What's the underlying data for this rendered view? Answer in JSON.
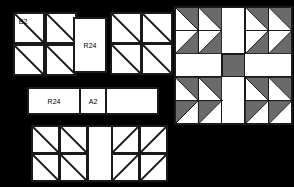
{
  "page": {
    "width": 294,
    "height": 187,
    "background": "#ffffff"
  },
  "style": {
    "outline_color": "#1a1a1a",
    "fill_light": "#ffffff",
    "fill_dark": "#6a6a6a",
    "diagonal_color": "#1a1a1a",
    "outline_width": 1.6,
    "diagonal_width": 1.8
  },
  "left_panel": {
    "name": "cut-pieces-legend",
    "description": "Cut piece groups with part labels",
    "groups": [
      {
        "id": "group-hst-topleft",
        "kind": "half-square-triangle-grid",
        "rows": 2,
        "cols": 2,
        "x": 14,
        "y": 13,
        "cell": 30,
        "gap": 2,
        "diagonal": "tl-br",
        "labels": [
          {
            "cell": 0,
            "text": "B2"
          }
        ]
      },
      {
        "id": "group-r24-vertical",
        "kind": "plain-rectangle",
        "x": 74,
        "y": 18,
        "width": 32,
        "height": 54,
        "label": "R24"
      },
      {
        "id": "group-hst-topright",
        "kind": "half-square-triangle-grid",
        "rows": 2,
        "cols": 2,
        "x": 111,
        "y": 13,
        "cell": 30,
        "gap": 1,
        "diagonal": "tl-br",
        "labels": []
      },
      {
        "id": "group-strip-r24-a2",
        "kind": "labelled-strip",
        "x": 28,
        "y": 88,
        "height": 26,
        "cells": [
          {
            "label": "R24",
            "width": 52
          },
          {
            "label": "A2",
            "width": 26
          },
          {
            "label": "",
            "width": 52
          }
        ]
      },
      {
        "id": "group-hst-bottomleft",
        "kind": "half-square-triangle-grid",
        "rows": 2,
        "cols": 2,
        "x": 32,
        "y": 126,
        "cell": 27,
        "gap": 1,
        "diagonal": "tl-br",
        "labels": []
      },
      {
        "id": "group-plain-bottomcenter",
        "kind": "plain-rectangle",
        "x": 88,
        "y": 126,
        "width": 24,
        "height": 55,
        "label": ""
      },
      {
        "id": "group-hst-bottomright",
        "kind": "half-square-triangle-grid",
        "rows": 2,
        "cols": 2,
        "x": 112,
        "y": 126,
        "cell": 27,
        "gap": 1,
        "diagonal": "bl-tr",
        "labels": []
      }
    ],
    "part_labels": [
      "B2",
      "R24",
      "R24",
      "A2"
    ]
  },
  "right_panel": {
    "name": "assembled-quilt-block",
    "description": "Finished 5x5 patchwork block preview",
    "x": 175,
    "y": 7,
    "cell": 23.4,
    "rows": 5,
    "cols": 5,
    "grid": [
      [
        "hst-tr",
        "hst-tr",
        "blank",
        "hst-tr",
        "hst-tr"
      ],
      [
        "hst-br",
        "hst-br",
        "blank",
        "hst-br",
        "hst-br"
      ],
      [
        "blank",
        "blank",
        "solid",
        "blank",
        "blank"
      ],
      [
        "hst-tr2",
        "hst-tr2",
        "blank",
        "hst-tr2",
        "hst-tr2"
      ],
      [
        "hst-br2",
        "hst-br2",
        "blank",
        "hst-br2",
        "hst-br2"
      ]
    ],
    "legend": {
      "blank": "plain light square",
      "solid": "solid dark square",
      "hst": "half-square triangle, dark half"
    }
  }
}
